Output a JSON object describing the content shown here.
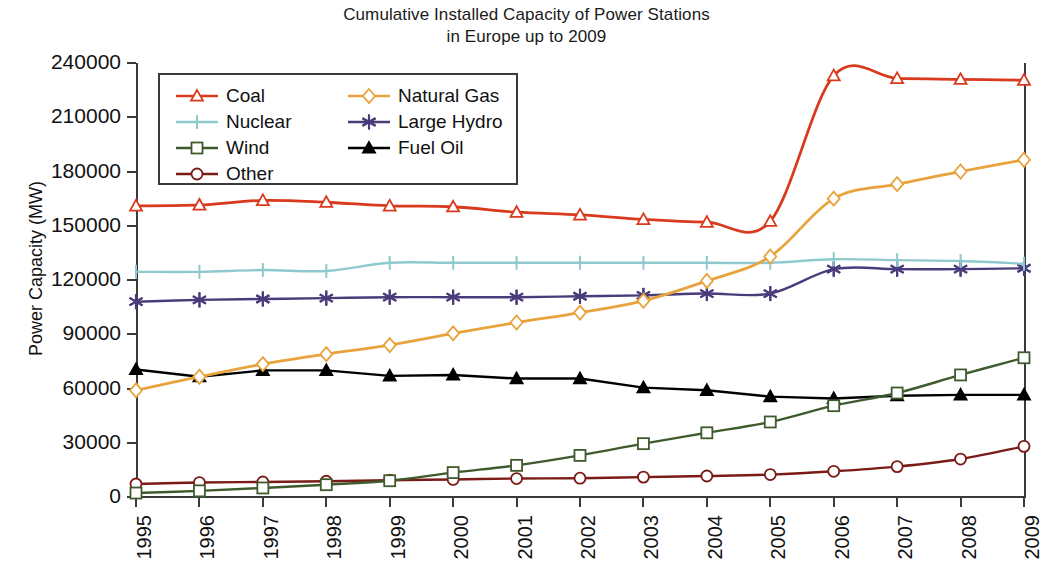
{
  "chart_data": {
    "type": "line",
    "title": "Cumulative Installed Capacity of Power Stations in Europe up to 2009",
    "title_line1": "Cumulative Installed Capacity of Power Stations",
    "title_line2": "in Europe up to 2009",
    "xlabel": "",
    "ylabel": "Power Capacity (MW)",
    "x": [
      1995,
      1996,
      1997,
      1998,
      1999,
      2000,
      2001,
      2002,
      2003,
      2004,
      2005,
      2006,
      2007,
      2008,
      2009
    ],
    "categories": [
      "1995",
      "1996",
      "1997",
      "1998",
      "1999",
      "2000",
      "2001",
      "2002",
      "2003",
      "2004",
      "2005",
      "2006",
      "2007",
      "2008",
      "2009"
    ],
    "ylim": [
      0,
      240000
    ],
    "yticks": [
      0,
      30000,
      60000,
      90000,
      120000,
      150000,
      180000,
      210000,
      240000
    ],
    "ytick_labels": [
      "0",
      "30000",
      "60000",
      "90000",
      "120000",
      "150000",
      "180000",
      "210000",
      "240000"
    ],
    "grid": false,
    "legend_position": "upper-left",
    "series": [
      {
        "name": "Coal",
        "color": "#D93A1E",
        "marker": "triangle-open",
        "values": [
          161000,
          161500,
          164000,
          163000,
          161000,
          160500,
          157500,
          156000,
          153500,
          152000,
          152500,
          233000,
          231500,
          231000,
          230500
        ]
      },
      {
        "name": "Nuclear",
        "color": "#8FC9CE",
        "marker": "plus",
        "values": [
          124500,
          124500,
          125500,
          125000,
          129500,
          129500,
          129500,
          129500,
          129500,
          129500,
          129500,
          131500,
          131000,
          130500,
          129000
        ]
      },
      {
        "name": "Wind",
        "color": "#3F5B2E",
        "marker": "square-open",
        "values": [
          2200,
          3400,
          5000,
          6800,
          9000,
          13500,
          17500,
          23000,
          29500,
          35500,
          41500,
          50500,
          57500,
          67500,
          77000
        ]
      },
      {
        "name": "Other",
        "color": "#7A1B18",
        "marker": "circle-open",
        "values": [
          7200,
          8000,
          8300,
          8700,
          9300,
          9700,
          10200,
          10400,
          11000,
          11600,
          12400,
          14200,
          16800,
          21000,
          28000
        ]
      },
      {
        "name": "Natural Gas",
        "color": "#E8A33D",
        "marker": "diamond-open",
        "values": [
          59000,
          66500,
          73500,
          79000,
          84000,
          90500,
          96500,
          102000,
          108500,
          119500,
          133000,
          165000,
          173000,
          180000,
          186500
        ]
      },
      {
        "name": "Large Hydro",
        "color": "#4A3C7A",
        "marker": "asterisk",
        "values": [
          108000,
          109000,
          109500,
          110000,
          110500,
          110500,
          110500,
          111000,
          111500,
          112500,
          112500,
          126000,
          126000,
          126000,
          126500
        ]
      },
      {
        "name": "Fuel Oil",
        "color": "#000000",
        "marker": "triangle-filled",
        "values": [
          70500,
          66500,
          70000,
          70000,
          67000,
          67500,
          65500,
          65500,
          60500,
          59000,
          55500,
          54500,
          56000,
          56500,
          56500
        ]
      }
    ]
  },
  "legend": {
    "columns": [
      [
        "Coal",
        "Nuclear",
        "Wind",
        "Other"
      ],
      [
        "Natural Gas",
        "Large Hydro",
        "Fuel Oil"
      ]
    ]
  }
}
